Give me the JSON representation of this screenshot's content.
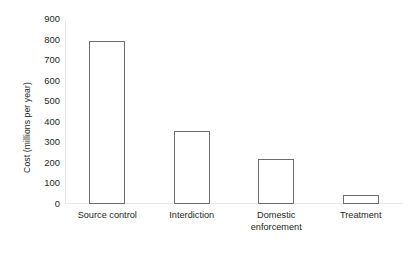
{
  "chart_data": {
    "type": "bar",
    "title": "",
    "xlabel": "",
    "ylabel": "Cost (millions per year)",
    "categories": [
      "Source control",
      "Interdiction",
      "Domestic enforcement",
      "Treatment"
    ],
    "values": [
      795,
      355,
      220,
      45
    ],
    "ylim": [
      0,
      900
    ],
    "yticks": [
      900,
      800,
      700,
      600,
      500,
      400,
      300,
      200,
      100,
      0
    ],
    "ytick_labels": [
      "900",
      "800",
      "700",
      "600",
      "500",
      "400",
      "300",
      "200",
      "100",
      "0"
    ],
    "grid": false,
    "legend": "none",
    "series": [
      {
        "name": "Cost",
        "values": [
          795,
          355,
          220,
          45
        ]
      }
    ],
    "bar_style": {
      "fill": "#ffffff",
      "stroke": "#6c6c6c"
    },
    "axis_color": "#e9e7e7",
    "text_color": "#231f20"
  },
  "category_lines": [
    [
      "Source control"
    ],
    [
      "Interdiction"
    ],
    [
      "Domestic",
      "enforcement"
    ],
    [
      "Treatment"
    ]
  ]
}
